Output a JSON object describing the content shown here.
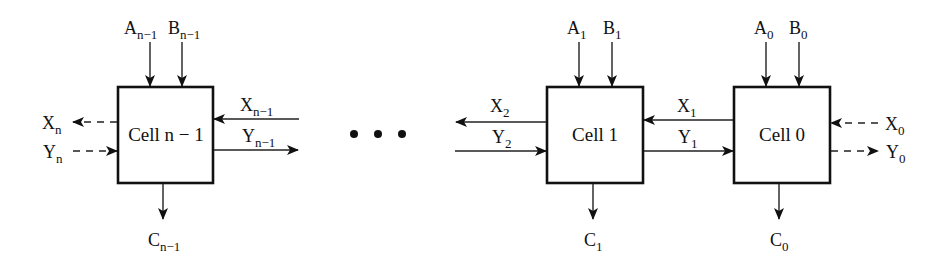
{
  "diagram": {
    "type": "cascaded iterative cell array (comparator chain)",
    "cells": [
      {
        "id": "cell-n-1",
        "label": "Cell n − 1",
        "inputs_top": [
          {
            "base": "A",
            "sub": "n−1"
          },
          {
            "base": "B",
            "sub": "n−1"
          }
        ],
        "output_bottom": {
          "base": "C",
          "sub": "n−1"
        },
        "left_signals": [
          {
            "base": "X",
            "sub": "n",
            "direction": "out",
            "style": "dashed"
          },
          {
            "base": "Y",
            "sub": "n",
            "direction": "in",
            "style": "dashed"
          }
        ],
        "right_signals": [
          {
            "base": "X",
            "sub": "n−1",
            "direction": "in",
            "style": "solid"
          },
          {
            "base": "Y",
            "sub": "n−1",
            "direction": "out",
            "style": "solid"
          }
        ]
      },
      {
        "id": "cell-1",
        "label": "Cell 1",
        "inputs_top": [
          {
            "base": "A",
            "sub": "1"
          },
          {
            "base": "B",
            "sub": "1"
          }
        ],
        "output_bottom": {
          "base": "C",
          "sub": "1"
        },
        "left_signals": [
          {
            "base": "X",
            "sub": "2",
            "direction": "out",
            "style": "solid"
          },
          {
            "base": "Y",
            "sub": "2",
            "direction": "in",
            "style": "solid"
          }
        ],
        "right_signals": [
          {
            "base": "X",
            "sub": "1",
            "direction": "in",
            "style": "solid"
          },
          {
            "base": "Y",
            "sub": "1",
            "direction": "out",
            "style": "solid"
          }
        ]
      },
      {
        "id": "cell-0",
        "label": "Cell 0",
        "inputs_top": [
          {
            "base": "A",
            "sub": "0"
          },
          {
            "base": "B",
            "sub": "0"
          }
        ],
        "output_bottom": {
          "base": "C",
          "sub": "0"
        },
        "right_signals": [
          {
            "base": "X",
            "sub": "0",
            "direction": "in",
            "style": "dashed"
          },
          {
            "base": "Y",
            "sub": "0",
            "direction": "out",
            "style": "dashed"
          }
        ]
      }
    ],
    "ellipsis": "• • •"
  }
}
